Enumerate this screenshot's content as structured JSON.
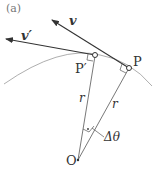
{
  "figure": {
    "panel_label": "(a)",
    "labels": {
      "v": "v",
      "v_prime": "v′",
      "P": "P",
      "P_prime": "P′",
      "r_left": "r",
      "r_right": "r",
      "O": "O",
      "delta_theta": "Δθ"
    },
    "colors": {
      "arrow": "#333333",
      "arc": "#999999",
      "radius": "#555555",
      "text": "#333333"
    }
  }
}
